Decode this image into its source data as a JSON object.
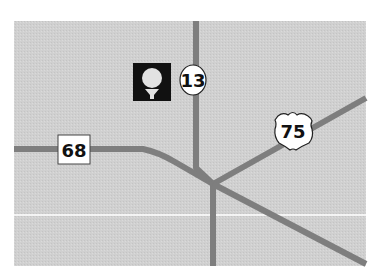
{
  "map": {
    "background_color": "#cfcfcf",
    "road_color": "#7e7e7e",
    "divider_color": "#ffffff",
    "frame": {
      "x": 14,
      "y": 21,
      "width": 352,
      "height": 245
    }
  },
  "markers": {
    "golf": {
      "icon": "golf-ball-on-tee-icon",
      "x": 133,
      "y": 63,
      "size": 38
    },
    "route_13": {
      "label": "13",
      "type": "state-circle",
      "cx": 193,
      "cy": 80
    },
    "route_68": {
      "label": "68",
      "type": "square",
      "x": 58,
      "y": 135
    },
    "route_75": {
      "label": "75",
      "type": "us-shield",
      "x": 275,
      "y": 110
    }
  },
  "roads": [
    {
      "name": "route-13-north",
      "d": "M196 21 L196 168 L213 184"
    },
    {
      "name": "route-13-south",
      "d": "M213 184 L213 266"
    },
    {
      "name": "route-68",
      "d": "M14 149 L143 149 Q158 152 175 162 L213 184"
    },
    {
      "name": "route-75",
      "d": "M213 184 L366 98"
    },
    {
      "name": "southeast-road",
      "d": "M213 184 L366 264"
    }
  ],
  "divider": {
    "y": 215
  }
}
